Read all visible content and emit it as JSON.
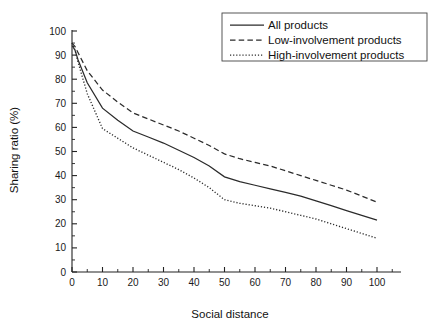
{
  "figure": {
    "top_cut_text": "",
    "background": "#ffffff",
    "line_color": "#2b2b2b"
  },
  "chart_data": {
    "type": "line",
    "title": "",
    "xlabel": "Social distance",
    "ylabel": "Sharing ratio (%)",
    "xlim": [
      0,
      108
    ],
    "ylim": [
      0,
      100
    ],
    "xticks": [
      0,
      10,
      20,
      30,
      40,
      50,
      60,
      70,
      80,
      90,
      100
    ],
    "xtick_labels": [
      "0",
      "10",
      "20",
      "30",
      "40",
      "50",
      "60",
      "70",
      "80",
      "90",
      "100"
    ],
    "yticks": [
      0,
      10,
      20,
      30,
      40,
      50,
      60,
      70,
      80,
      90,
      100
    ],
    "ytick_labels": [
      "0",
      "10",
      "20",
      "30",
      "40",
      "50",
      "60",
      "70",
      "80",
      "90",
      "100"
    ],
    "grid": false,
    "minor_ticks": true,
    "legend_position": "top-right",
    "x": [
      0,
      1,
      2,
      5,
      10,
      15,
      20,
      25,
      30,
      35,
      40,
      45,
      50,
      55,
      60,
      65,
      70,
      75,
      80,
      85,
      90,
      95,
      100
    ],
    "series": [
      {
        "name": "All products",
        "style": "solid",
        "values": [
          94.0,
          92.0,
          88.0,
          78.5,
          68.0,
          63.0,
          58.5,
          56.0,
          53.5,
          50.5,
          47.5,
          44.0,
          39.5,
          37.5,
          36.0,
          34.5,
          33.0,
          31.5,
          29.5,
          27.5,
          25.5,
          23.5,
          21.5
        ]
      },
      {
        "name": "Low-involvement products",
        "style": "dashed",
        "values": [
          95.0,
          93.5,
          91.0,
          83.5,
          75.5,
          70.5,
          66.0,
          63.5,
          61.0,
          58.5,
          55.5,
          52.5,
          49.0,
          47.0,
          45.5,
          44.0,
          42.0,
          40.0,
          38.0,
          36.0,
          34.0,
          31.5,
          29.0
        ]
      },
      {
        "name": "High-involvement products",
        "style": "dotted",
        "values": [
          95.0,
          92.0,
          87.0,
          74.0,
          59.5,
          55.5,
          51.5,
          48.5,
          45.5,
          42.5,
          39.0,
          35.0,
          30.0,
          28.5,
          27.5,
          26.5,
          25.0,
          23.5,
          22.0,
          20.0,
          18.0,
          16.0,
          14.0
        ]
      }
    ]
  },
  "legend": {
    "items": [
      {
        "label": "All products",
        "style": "solid"
      },
      {
        "label": "Low-involvement products",
        "style": "dashed"
      },
      {
        "label": "High-involvement products",
        "style": "dotted"
      }
    ]
  }
}
